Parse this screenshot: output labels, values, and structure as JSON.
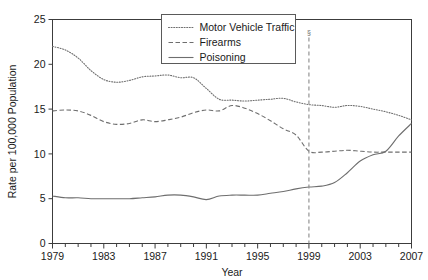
{
  "chart_data": {
    "type": "line",
    "title": "",
    "xlabel": "Year",
    "ylabel": "Rate per 100,000 Population",
    "xlim": [
      1979,
      2007
    ],
    "ylim": [
      0,
      25
    ],
    "yticks": [
      "0",
      "5",
      "10",
      "15",
      "20",
      "25"
    ],
    "ytick_values": [
      0,
      5,
      10,
      15,
      20,
      25
    ],
    "xticks": [
      "1979",
      "1983",
      "1987",
      "1991",
      "1995",
      "1999",
      "2003",
      "2007"
    ],
    "xtick_values": [
      1979,
      1983,
      1987,
      1991,
      1995,
      1999,
      2003,
      2007
    ],
    "minor_xticks_every": 1,
    "grid": false,
    "legend_position": "top-center",
    "x": [
      1979,
      1980,
      1981,
      1982,
      1983,
      1984,
      1985,
      1986,
      1987,
      1988,
      1989,
      1990,
      1991,
      1992,
      1993,
      1994,
      1995,
      1996,
      1997,
      1998,
      1999,
      2000,
      2001,
      2002,
      2003,
      2004,
      2005,
      2006,
      2007
    ],
    "series": [
      {
        "name": "Motor Vehicle Traffic",
        "style": "dotted",
        "values": [
          22.0,
          21.6,
          20.7,
          19.3,
          18.3,
          18.0,
          18.2,
          18.6,
          18.7,
          18.8,
          18.5,
          18.5,
          17.3,
          16.1,
          16.0,
          15.9,
          16.0,
          16.1,
          16.2,
          15.8,
          15.5,
          15.4,
          15.2,
          15.4,
          15.3,
          15.0,
          14.7,
          14.3,
          13.8
        ]
      },
      {
        "name": "Firearms",
        "style": "dashed",
        "values": [
          14.8,
          14.9,
          14.8,
          14.3,
          13.6,
          13.3,
          13.4,
          13.8,
          13.6,
          13.8,
          14.1,
          14.6,
          14.9,
          14.8,
          15.4,
          15.1,
          14.5,
          13.7,
          12.8,
          12.1,
          10.3,
          10.2,
          10.3,
          10.4,
          10.3,
          10.2,
          10.2,
          10.2,
          10.2
        ]
      },
      {
        "name": "Poisoning",
        "style": "solid",
        "values": [
          5.3,
          5.1,
          5.1,
          5.0,
          5.0,
          5.0,
          5.0,
          5.1,
          5.2,
          5.4,
          5.4,
          5.2,
          4.9,
          5.3,
          5.4,
          5.4,
          5.4,
          5.6,
          5.8,
          6.1,
          6.3,
          6.4,
          6.8,
          7.9,
          9.2,
          9.9,
          10.3,
          12.0,
          13.4
        ]
      }
    ],
    "annotations": [
      {
        "name": "icd-revision-marker",
        "kind": "vertical-dashed-line",
        "x": 1999,
        "symbol": "§"
      }
    ]
  },
  "legend": {
    "items": [
      {
        "label": "Motor Vehicle Traffic",
        "style": "dotted"
      },
      {
        "label": "Firearms",
        "style": "dashed"
      },
      {
        "label": "Poisoning",
        "style": "solid"
      }
    ]
  },
  "colors": {
    "line": "#6e6e6e",
    "axis": "#3c3c3c",
    "text": "#1a1a1a",
    "background": "#ffffff",
    "marker": "#8a8a8a"
  }
}
